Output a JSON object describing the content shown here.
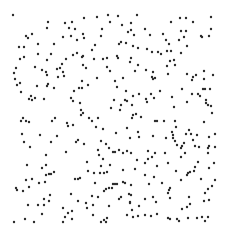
{
  "image": {
    "width": 228,
    "height": 239,
    "background": "#ffffff",
    "dot_color": "#2a2a2a",
    "dot_radius": 1.2
  },
  "dots": [
    [
      13,
      15
    ],
    [
      48,
      22
    ],
    [
      47,
      28
    ],
    [
      65,
      23
    ],
    [
      72,
      22
    ],
    [
      84,
      18
    ],
    [
      97,
      17
    ],
    [
      108,
      15
    ],
    [
      110,
      22
    ],
    [
      26,
      36
    ],
    [
      28,
      38
    ],
    [
      32,
      34
    ],
    [
      69,
      28
    ],
    [
      75,
      29
    ],
    [
      71,
      36
    ],
    [
      83,
      34
    ],
    [
      84,
      38
    ],
    [
      63,
      37
    ],
    [
      77,
      40
    ],
    [
      101,
      36
    ],
    [
      102,
      29
    ],
    [
      38,
      44
    ],
    [
      54,
      44
    ],
    [
      95,
      45
    ],
    [
      19,
      47
    ],
    [
      24,
      47
    ],
    [
      92,
      50
    ],
    [
      38,
      54
    ],
    [
      51,
      54
    ],
    [
      73,
      55
    ],
    [
      77,
      53
    ],
    [
      82,
      57
    ],
    [
      83,
      56
    ],
    [
      20,
      59
    ],
    [
      24,
      57
    ],
    [
      47,
      60
    ],
    [
      66,
      59
    ],
    [
      94,
      59
    ],
    [
      103,
      59
    ],
    [
      107,
      58
    ],
    [
      62,
      64
    ],
    [
      35,
      67
    ],
    [
      16,
      68
    ],
    [
      83,
      65
    ],
    [
      86,
      68
    ],
    [
      107,
      67
    ],
    [
      42,
      70
    ],
    [
      46,
      72
    ],
    [
      57,
      69
    ],
    [
      60,
      68
    ],
    [
      110,
      71
    ],
    [
      14,
      73
    ],
    [
      63,
      72
    ],
    [
      47,
      75
    ],
    [
      58,
      77
    ],
    [
      64,
      76
    ],
    [
      15,
      79
    ],
    [
      97,
      78
    ],
    [
      82,
      81
    ],
    [
      20,
      83
    ],
    [
      17,
      85
    ],
    [
      48,
      84
    ],
    [
      47,
      86
    ],
    [
      37,
      86
    ],
    [
      79,
      88
    ],
    [
      82,
      88
    ],
    [
      88,
      85
    ],
    [
      54,
      88
    ],
    [
      21,
      92
    ],
    [
      74,
      91
    ],
    [
      31,
      96
    ],
    [
      29,
      99
    ],
    [
      35,
      98
    ],
    [
      32,
      100
    ],
    [
      44,
      99
    ],
    [
      71,
      98
    ],
    [
      73,
      101
    ],
    [
      80,
      103
    ],
    [
      81,
      110
    ],
    [
      81,
      115
    ],
    [
      83,
      113
    ],
    [
      111,
      108
    ],
    [
      23,
      118
    ],
    [
      55,
      118
    ],
    [
      89,
      118
    ],
    [
      98,
      118
    ],
    [
      118,
      16
    ],
    [
      137,
      15
    ],
    [
      180,
      18
    ],
    [
      186,
      18
    ],
    [
      211,
      17
    ],
    [
      122,
      25
    ],
    [
      131,
      23
    ],
    [
      171,
      22
    ],
    [
      193,
      22
    ],
    [
      211,
      29
    ],
    [
      128,
      32
    ],
    [
      131,
      30
    ],
    [
      145,
      29
    ],
    [
      134,
      35
    ],
    [
      150,
      35
    ],
    [
      163,
      34
    ],
    [
      181,
      31
    ],
    [
      186,
      31
    ],
    [
      184,
      37
    ],
    [
      201,
      36
    ],
    [
      202,
      37
    ],
    [
      209,
      36
    ],
    [
      166,
      40
    ],
    [
      179,
      40
    ],
    [
      119,
      44
    ],
    [
      121,
      42
    ],
    [
      126,
      43
    ],
    [
      169,
      44
    ],
    [
      187,
      46
    ],
    [
      133,
      46
    ],
    [
      138,
      48
    ],
    [
      147,
      49
    ],
    [
      152,
      52
    ],
    [
      158,
      52
    ],
    [
      161,
      54
    ],
    [
      167,
      51
    ],
    [
      171,
      51
    ],
    [
      181,
      53
    ],
    [
      117,
      56
    ],
    [
      118,
      58
    ],
    [
      131,
      58
    ],
    [
      130,
      62
    ],
    [
      170,
      61
    ],
    [
      174,
      60
    ],
    [
      138,
      65
    ],
    [
      167,
      66
    ],
    [
      175,
      65
    ],
    [
      146,
      70
    ],
    [
      153,
      72
    ],
    [
      135,
      71
    ],
    [
      187,
      74
    ],
    [
      168,
      74
    ],
    [
      193,
      77
    ],
    [
      196,
      75
    ],
    [
      204,
      71
    ],
    [
      213,
      75
    ],
    [
      152,
      77
    ],
    [
      153,
      79
    ],
    [
      155,
      78
    ],
    [
      123,
      78
    ],
    [
      115,
      81
    ],
    [
      192,
      80
    ],
    [
      204,
      79
    ],
    [
      117,
      87
    ],
    [
      126,
      91
    ],
    [
      182,
      89
    ],
    [
      203,
      89
    ],
    [
      205,
      89
    ],
    [
      210,
      89
    ],
    [
      160,
      91
    ],
    [
      151,
      94
    ],
    [
      133,
      96
    ],
    [
      139,
      94
    ],
    [
      192,
      94
    ],
    [
      198,
      94
    ],
    [
      200,
      96
    ],
    [
      154,
      98
    ],
    [
      172,
      97
    ],
    [
      146,
      99
    ],
    [
      125,
      100
    ],
    [
      127,
      101
    ],
    [
      147,
      102
    ],
    [
      206,
      100
    ],
    [
      187,
      102
    ],
    [
      206,
      103
    ],
    [
      208,
      105
    ],
    [
      211,
      106
    ],
    [
      121,
      105
    ],
    [
      114,
      100
    ],
    [
      132,
      105
    ],
    [
      174,
      107
    ],
    [
      120,
      110
    ],
    [
      212,
      113
    ],
    [
      133,
      115
    ],
    [
      136,
      114
    ],
    [
      141,
      117
    ],
    [
      132,
      118
    ],
    [
      21,
      121
    ],
    [
      26,
      121
    ],
    [
      29,
      122
    ],
    [
      52,
      121
    ],
    [
      67,
      123
    ],
    [
      68,
      126
    ],
    [
      73,
      125
    ],
    [
      92,
      121
    ],
    [
      96,
      127
    ],
    [
      103,
      129
    ],
    [
      22,
      134
    ],
    [
      40,
      135
    ],
    [
      57,
      136
    ],
    [
      24,
      142
    ],
    [
      51,
      142
    ],
    [
      76,
      142
    ],
    [
      78,
      140
    ],
    [
      84,
      144
    ],
    [
      101,
      141
    ],
    [
      106,
      144
    ],
    [
      30,
      147
    ],
    [
      109,
      148
    ],
    [
      98,
      150
    ],
    [
      66,
      152
    ],
    [
      99,
      155
    ],
    [
      113,
      152
    ],
    [
      46,
      155
    ],
    [
      103,
      159
    ],
    [
      87,
      162
    ],
    [
      27,
      165
    ],
    [
      46,
      165
    ],
    [
      42,
      168
    ],
    [
      101,
      166
    ],
    [
      110,
      165
    ],
    [
      88,
      171
    ],
    [
      54,
      172
    ],
    [
      49,
      174
    ],
    [
      51,
      174
    ],
    [
      46,
      175
    ],
    [
      94,
      173
    ],
    [
      100,
      173
    ],
    [
      104,
      173
    ],
    [
      107,
      172
    ],
    [
      32,
      179
    ],
    [
      26,
      180
    ],
    [
      75,
      179
    ],
    [
      78,
      179
    ],
    [
      80,
      178
    ],
    [
      39,
      183
    ],
    [
      45,
      182
    ],
    [
      95,
      183
    ],
    [
      29,
      187
    ],
    [
      113,
      184
    ],
    [
      16,
      188
    ],
    [
      17,
      190
    ],
    [
      23,
      191
    ],
    [
      104,
      191
    ],
    [
      106,
      189
    ],
    [
      109,
      188
    ],
    [
      112,
      188
    ],
    [
      71,
      194
    ],
    [
      50,
      195
    ],
    [
      92,
      196
    ],
    [
      98,
      197
    ],
    [
      44,
      199
    ],
    [
      49,
      201
    ],
    [
      78,
      201
    ],
    [
      28,
      205
    ],
    [
      38,
      205
    ],
    [
      44,
      205
    ],
    [
      86,
      203
    ],
    [
      93,
      205
    ],
    [
      109,
      206
    ],
    [
      63,
      208
    ],
    [
      87,
      208
    ],
    [
      72,
      211
    ],
    [
      68,
      213
    ],
    [
      42,
      214
    ],
    [
      93,
      215
    ],
    [
      65,
      217
    ],
    [
      107,
      218
    ],
    [
      25,
      219
    ],
    [
      72,
      219
    ],
    [
      104,
      220
    ],
    [
      14,
      222
    ],
    [
      34,
      222
    ],
    [
      63,
      222
    ],
    [
      101,
      222
    ],
    [
      106,
      222
    ],
    [
      155,
      121
    ],
    [
      157,
      121
    ],
    [
      164,
      121
    ],
    [
      175,
      121
    ],
    [
      204,
      122
    ],
    [
      176,
      127
    ],
    [
      127,
      128
    ],
    [
      189,
      130
    ],
    [
      138,
      132
    ],
    [
      116,
      133
    ],
    [
      172,
      132
    ],
    [
      173,
      135
    ],
    [
      186,
      134
    ],
    [
      191,
      134
    ],
    [
      197,
      135
    ],
    [
      215,
      134
    ],
    [
      153,
      136
    ],
    [
      130,
      138
    ],
    [
      139,
      137
    ],
    [
      166,
      138
    ],
    [
      173,
      138
    ],
    [
      209,
      137
    ],
    [
      175,
      141
    ],
    [
      193,
      140
    ],
    [
      177,
      145
    ],
    [
      184,
      143
    ],
    [
      182,
      146
    ],
    [
      195,
      146
    ],
    [
      209,
      146
    ],
    [
      199,
      147
    ],
    [
      215,
      147
    ],
    [
      208,
      148
    ],
    [
      181,
      148
    ],
    [
      119,
      150
    ],
    [
      127,
      151
    ],
    [
      148,
      151
    ],
    [
      115,
      152
    ],
    [
      123,
      153
    ],
    [
      131,
      153
    ],
    [
      155,
      153
    ],
    [
      185,
      153
    ],
    [
      208,
      153
    ],
    [
      165,
      153
    ],
    [
      152,
      157
    ],
    [
      181,
      157
    ],
    [
      137,
      160
    ],
    [
      148,
      159
    ],
    [
      145,
      163
    ],
    [
      198,
      162
    ],
    [
      214,
      163
    ],
    [
      168,
      163
    ],
    [
      157,
      166
    ],
    [
      195,
      167
    ],
    [
      209,
      168
    ],
    [
      123,
      170
    ],
    [
      135,
      169
    ],
    [
      176,
      171
    ],
    [
      190,
      172
    ],
    [
      188,
      173
    ],
    [
      194,
      171
    ],
    [
      145,
      175
    ],
    [
      154,
      177
    ],
    [
      187,
      175
    ],
    [
      201,
      179
    ],
    [
      215,
      180
    ],
    [
      181,
      180
    ],
    [
      115,
      184
    ],
    [
      117,
      184
    ],
    [
      123,
      182
    ],
    [
      125,
      183
    ],
    [
      149,
      184
    ],
    [
      162,
      183
    ],
    [
      131,
      185
    ],
    [
      212,
      186
    ],
    [
      170,
      188
    ],
    [
      208,
      189
    ],
    [
      169,
      190
    ],
    [
      205,
      193
    ],
    [
      168,
      193
    ],
    [
      129,
      194
    ],
    [
      131,
      195
    ],
    [
      121,
      197
    ],
    [
      153,
      197
    ],
    [
      170,
      198
    ],
    [
      189,
      197
    ],
    [
      119,
      199
    ],
    [
      145,
      199
    ],
    [
      130,
      202
    ],
    [
      130,
      203
    ],
    [
      156,
      202
    ],
    [
      190,
      204
    ],
    [
      204,
      201
    ],
    [
      209,
      200
    ],
    [
      187,
      207
    ],
    [
      139,
      206
    ],
    [
      132,
      210
    ],
    [
      182,
      209
    ],
    [
      127,
      215
    ],
    [
      133,
      217
    ],
    [
      138,
      216
    ],
    [
      145,
      215
    ],
    [
      151,
      216
    ],
    [
      157,
      214
    ],
    [
      168,
      218
    ],
    [
      170,
      219
    ],
    [
      177,
      219
    ],
    [
      179,
      221
    ],
    [
      188,
      218
    ],
    [
      197,
      218
    ],
    [
      202,
      217
    ],
    [
      208,
      217
    ],
    [
      205,
      221
    ]
  ]
}
